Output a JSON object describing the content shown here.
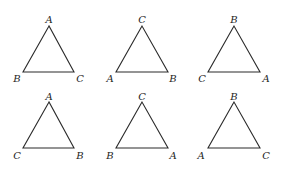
{
  "figure": {
    "background": "#ffffff",
    "line_color": "#2b2b2b",
    "triangles": [
      {
        "id": "t1",
        "row": 1,
        "col": 1,
        "vertices": {
          "top": [
            49,
            26
          ],
          "left": [
            23,
            72
          ],
          "right": [
            74,
            72
          ]
        },
        "labels": {
          "top": {
            "text": "A",
            "x": 49,
            "y": 19
          },
          "left": {
            "text": "B",
            "x": 17,
            "y": 78
          },
          "right": {
            "text": "C",
            "x": 80,
            "y": 78
          }
        }
      },
      {
        "id": "t2",
        "row": 1,
        "col": 2,
        "vertices": {
          "top": [
            142,
            26
          ],
          "left": [
            116,
            72
          ],
          "right": [
            168,
            72
          ]
        },
        "labels": {
          "top": {
            "text": "C",
            "x": 142,
            "y": 19
          },
          "left": {
            "text": "A",
            "x": 110,
            "y": 78
          },
          "right": {
            "text": "B",
            "x": 173,
            "y": 78
          }
        }
      },
      {
        "id": "t3",
        "row": 1,
        "col": 3,
        "vertices": {
          "top": [
            234,
            26
          ],
          "left": [
            208,
            72
          ],
          "right": [
            260,
            72
          ]
        },
        "labels": {
          "top": {
            "text": "B",
            "x": 234,
            "y": 19
          },
          "left": {
            "text": "C",
            "x": 202,
            "y": 78
          },
          "right": {
            "text": "A",
            "x": 266,
            "y": 78
          }
        }
      },
      {
        "id": "t4",
        "row": 2,
        "col": 1,
        "vertices": {
          "top": [
            49,
            102
          ],
          "left": [
            23,
            148
          ],
          "right": [
            74,
            148
          ]
        },
        "labels": {
          "top": {
            "text": "A",
            "x": 49,
            "y": 96
          },
          "left": {
            "text": "C",
            "x": 17,
            "y": 155
          },
          "right": {
            "text": "B",
            "x": 80,
            "y": 155
          }
        }
      },
      {
        "id": "t5",
        "row": 2,
        "col": 2,
        "vertices": {
          "top": [
            142,
            102
          ],
          "left": [
            116,
            148
          ],
          "right": [
            168,
            148
          ]
        },
        "labels": {
          "top": {
            "text": "C",
            "x": 142,
            "y": 96
          },
          "left": {
            "text": "B",
            "x": 110,
            "y": 155
          },
          "right": {
            "text": "A",
            "x": 173,
            "y": 155
          }
        }
      },
      {
        "id": "t6",
        "row": 2,
        "col": 3,
        "vertices": {
          "top": [
            234,
            102
          ],
          "left": [
            208,
            148
          ],
          "right": [
            260,
            148
          ]
        },
        "labels": {
          "top": {
            "text": "B",
            "x": 234,
            "y": 96
          },
          "left": {
            "text": "A",
            "x": 201,
            "y": 155
          },
          "right": {
            "text": "C",
            "x": 266,
            "y": 155
          }
        }
      }
    ]
  }
}
